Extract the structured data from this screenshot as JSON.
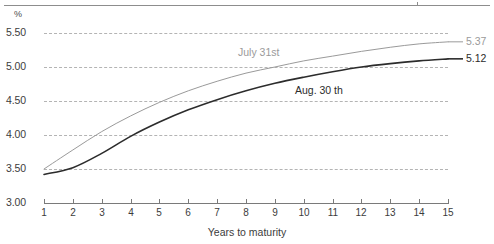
{
  "chart_data": {
    "type": "line",
    "title": "",
    "xlabel": "Years to maturity",
    "ylabel": "%",
    "y_unit_label": "%",
    "xlim": [
      1,
      15
    ],
    "ylim": [
      3.0,
      5.5
    ],
    "grid": true,
    "legend_position": "inline-annotation",
    "x": [
      1,
      2,
      3,
      4,
      5,
      6,
      7,
      8,
      9,
      10,
      11,
      12,
      13,
      14,
      15
    ],
    "y_ticks": [
      "5.50",
      "5.00",
      "4.50",
      "4.00",
      "3.50",
      "3.00"
    ],
    "y_tick_values": [
      5.5,
      5.0,
      4.5,
      4.0,
      3.5,
      3.0
    ],
    "x_ticks": [
      "1",
      "2",
      "3",
      "4",
      "5",
      "6",
      "7",
      "8",
      "9",
      "10",
      "11",
      "12",
      "13",
      "14",
      "15"
    ],
    "series": [
      {
        "name": "July 31st",
        "label": "July 31st",
        "color": "#9a9a9a",
        "end_value_label": "5.37",
        "end_value": 5.37,
        "values": [
          3.5,
          3.78,
          4.05,
          4.28,
          4.48,
          4.65,
          4.79,
          4.91,
          5.0,
          5.09,
          5.16,
          5.23,
          5.29,
          5.34,
          5.37
        ]
      },
      {
        "name": "Aug. 30 th",
        "label": "Aug. 30 th",
        "color": "#2c2c2c",
        "end_value_label": "5.12",
        "end_value": 5.12,
        "values": [
          3.42,
          3.52,
          3.73,
          3.98,
          4.19,
          4.37,
          4.52,
          4.65,
          4.76,
          4.85,
          4.93,
          5.0,
          5.05,
          5.09,
          5.12
        ]
      }
    ]
  }
}
